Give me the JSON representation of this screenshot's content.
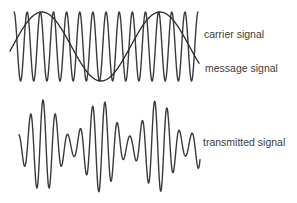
{
  "labels": {
    "carrier": "carrier signal",
    "message": "message signal",
    "transmitted": "transmitted signal"
  },
  "colors": {
    "stroke": "#3a3a3a",
    "text": "#3c3c3c",
    "background": "#ffffff"
  },
  "waves": {
    "carrier": {
      "x_start": 14,
      "x_end": 198,
      "center_y": 46.5,
      "amplitude": 34.5,
      "period": 13.15,
      "phase_x": 14,
      "kind": "cos"
    },
    "message": {
      "x_start": 10,
      "x_end": 199,
      "center_y": 46.5,
      "amplitude": 34.5,
      "period": 118,
      "phase_x": 42,
      "kind": "cos"
    },
    "transmitted": {
      "x_start": 19,
      "x_end": 200,
      "center_y": 146,
      "carrier_period": 12.4,
      "carrier_phase_x": 43,
      "message_period": 57.5,
      "message_phase_x": 43,
      "base_amplitude": 28,
      "modulation_amplitude": 18
    }
  }
}
